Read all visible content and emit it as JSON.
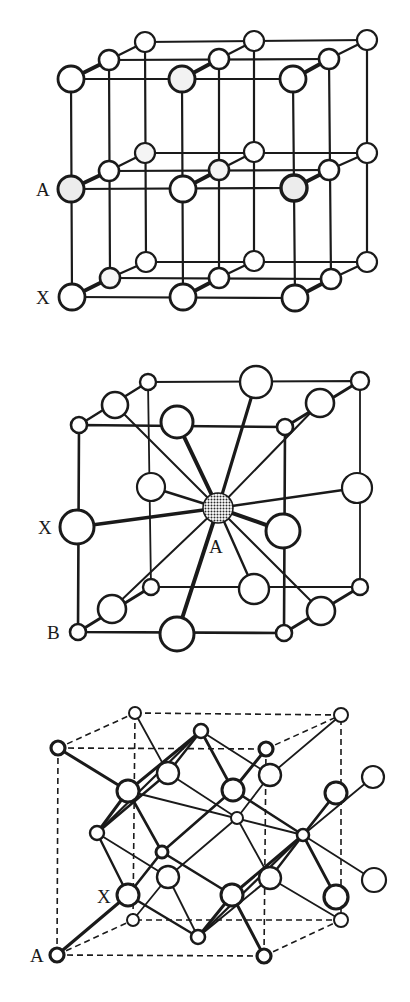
{
  "figure": {
    "colors": {
      "line": "#1a1a1a",
      "background": "#ffffff",
      "atom_fill": "#ffffff",
      "shaded_atom": "#9a9a9a"
    }
  },
  "structures": [
    {
      "id": "layered",
      "labels": [
        {
          "text": "A",
          "x": 36,
          "y": 196
        },
        {
          "text": "X",
          "x": 36,
          "y": 304
        }
      ],
      "layers_y": [
        0,
        110,
        219
      ],
      "columns": [
        {
          "front": [
            71,
            79
          ],
          "mid": [
            109,
            60
          ],
          "back": [
            145,
            42
          ]
        },
        {
          "front": [
            182,
            79
          ],
          "mid": [
            219,
            59
          ],
          "back": [
            254,
            41
          ]
        },
        {
          "front": [
            293,
            79
          ],
          "mid": [
            329,
            59
          ],
          "back": [
            367,
            40
          ]
        }
      ],
      "radii": {
        "front": 13,
        "mid": 10,
        "back": 10
      },
      "shaded": [
        [
          0,
          1
        ],
        [
          1,
          0
        ],
        [
          2,
          1
        ],
        [
          0,
          0,
          "mid"
        ]
      ]
    },
    {
      "id": "perovskite",
      "labels": [
        {
          "text": "X",
          "x": 38,
          "y": 534
        },
        {
          "text": "A",
          "x": 209,
          "y": 553
        },
        {
          "text": "B",
          "x": 47,
          "y": 639
        }
      ],
      "center_A": {
        "x": 218,
        "y": 508,
        "r": 15
      },
      "B_sites": [
        [
          79,
          425
        ],
        [
          148,
          382
        ],
        [
          285,
          427
        ],
        [
          360,
          381
        ],
        [
          78,
          632
        ],
        [
          151,
          587
        ],
        [
          284,
          633
        ],
        [
          360,
          587
        ]
      ],
      "X_sites": [
        [
          115,
          405,
          13
        ],
        [
          320,
          403,
          14
        ],
        [
          112,
          609,
          14
        ],
        [
          321,
          611,
          14
        ],
        [
          177,
          422,
          16
        ],
        [
          256,
          382,
          16
        ],
        [
          177,
          634,
          17
        ],
        [
          254,
          589,
          15
        ],
        [
          77,
          527,
          17
        ],
        [
          151,
          487,
          14
        ],
        [
          283,
          531,
          17
        ],
        [
          357,
          488,
          15
        ]
      ]
    },
    {
      "id": "spinel-like",
      "labels": [
        {
          "text": "X",
          "x": 97,
          "y": 903
        },
        {
          "text": "A",
          "x": 30,
          "y": 962
        }
      ],
      "cube": {
        "front": [
          [
            58,
            748
          ],
          [
            266,
            749
          ],
          [
            264,
            956
          ],
          [
            57,
            955
          ]
        ],
        "back": [
          [
            135,
            713
          ],
          [
            341,
            715
          ],
          [
            341,
            920
          ],
          [
            133,
            920
          ]
        ]
      },
      "small_atoms": [
        [
          58,
          748
        ],
        [
          266,
          749
        ],
        [
          264,
          956
        ],
        [
          57,
          955
        ],
        [
          135,
          713
        ],
        [
          341,
          715
        ],
        [
          341,
          920
        ],
        [
          133,
          920
        ],
        [
          201,
          731
        ],
        [
          97,
          833
        ],
        [
          303,
          835
        ],
        [
          198,
          937
        ],
        [
          162,
          852
        ],
        [
          237,
          818
        ]
      ],
      "large_atoms": [
        [
          128,
          791
        ],
        [
          168,
          773
        ],
        [
          233,
          790
        ],
        [
          270,
          775
        ],
        [
          128,
          895
        ],
        [
          168,
          877
        ],
        [
          232,
          895
        ],
        [
          270,
          878
        ],
        [
          336,
          793
        ],
        [
          373,
          777
        ],
        [
          336,
          897
        ],
        [
          374,
          880
        ]
      ]
    }
  ]
}
